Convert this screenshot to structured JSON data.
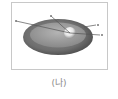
{
  "figure": {
    "caption": "(나)",
    "frame_color": "#c8c8c8",
    "diagram": {
      "description": "Elliptical disk with dark outer rim, lighter inner disk and a bright sphere; leader lines point to unlabeled markers",
      "outer_rim_color": "#6e6e6e",
      "inner_disk_color": "#9a9a9a",
      "sphere_color": "#f2f2f2",
      "leader_line_color": "#555555",
      "markers": [
        {
          "name": "marker-upper-left"
        },
        {
          "name": "marker-top"
        },
        {
          "name": "marker-right-upper"
        },
        {
          "name": "marker-right-lower"
        }
      ]
    }
  }
}
